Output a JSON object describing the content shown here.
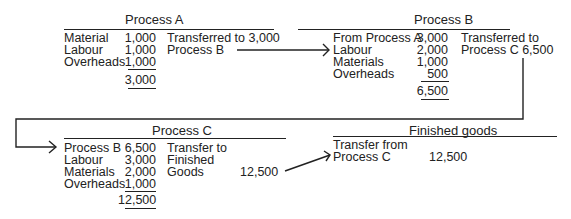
{
  "process_a": {
    "title": "Process A",
    "debits": [
      {
        "label": "Material",
        "amount": "1,000"
      },
      {
        "label": "Labour",
        "amount": "1,000"
      },
      {
        "label": "Overheads",
        "amount": "1,000"
      }
    ],
    "total": "3,000",
    "credit_line1": "Transferred to 3,000",
    "credit_line2": "Process B"
  },
  "process_b": {
    "title": "Process B",
    "debits": [
      {
        "label": "From Process A",
        "amount": "3,000"
      },
      {
        "label": "Labour",
        "amount": "2,000"
      },
      {
        "label": "Materials",
        "amount": "1,000"
      },
      {
        "label": "Overheads",
        "amount": "500"
      }
    ],
    "total": "6,500",
    "credit_line1": "Transferred to",
    "credit_line2": "Process C 6,500"
  },
  "process_c": {
    "title": "Process C",
    "debits": [
      {
        "label": "Process B",
        "amount": "6,500"
      },
      {
        "label": "Labour",
        "amount": "3,000"
      },
      {
        "label": "Materials",
        "amount": "2,000"
      },
      {
        "label": "Overheads",
        "amount": "1,000"
      }
    ],
    "total": "12,500",
    "credit_line1": "Transfer to",
    "credit_line2": "Finished",
    "credit_line3": "Goods",
    "credit_amount": "12,500"
  },
  "finished_goods": {
    "title": "Finished goods",
    "debit_line1": "Transfer from",
    "debit_line2": "Process C",
    "amount": "12,500"
  }
}
